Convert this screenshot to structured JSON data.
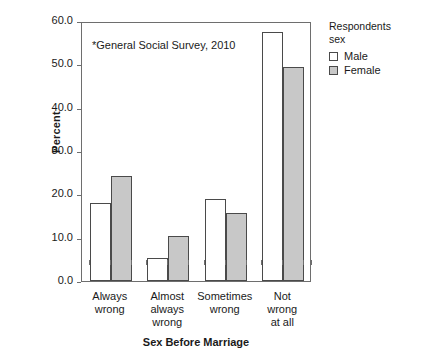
{
  "chart_data": {
    "type": "bar",
    "title": "",
    "annotation": "*General Social Survey, 2010",
    "xlabel": "Sex Before Marriage",
    "ylabel": "Percent",
    "ylim": [
      0,
      60
    ],
    "yticks": [
      "0.0",
      "10.0",
      "20.0",
      "30.0",
      "40.0",
      "50.0",
      "60.0"
    ],
    "ytick_values": [
      0,
      10,
      20,
      30,
      40,
      50,
      60
    ],
    "grid": false,
    "legend_position": "right",
    "legend_title": [
      "Respondents",
      "sex"
    ],
    "categories": [
      "Always wrong",
      "Almost always wrong",
      "Sometimes wrong",
      "Not wrong at all"
    ],
    "category_lines": [
      [
        "Always",
        "wrong"
      ],
      [
        "Almost",
        "always",
        "wrong"
      ],
      [
        "Sometimes",
        "wrong"
      ],
      [
        "Not",
        "wrong",
        "at all"
      ]
    ],
    "series": [
      {
        "name": "Male",
        "color": "#ffffff",
        "values": [
          18.1,
          5.3,
          18.9,
          57.4
        ]
      },
      {
        "name": "Female",
        "color": "#c8c8c8",
        "values": [
          24.2,
          10.4,
          15.7,
          49.4
        ]
      }
    ]
  }
}
